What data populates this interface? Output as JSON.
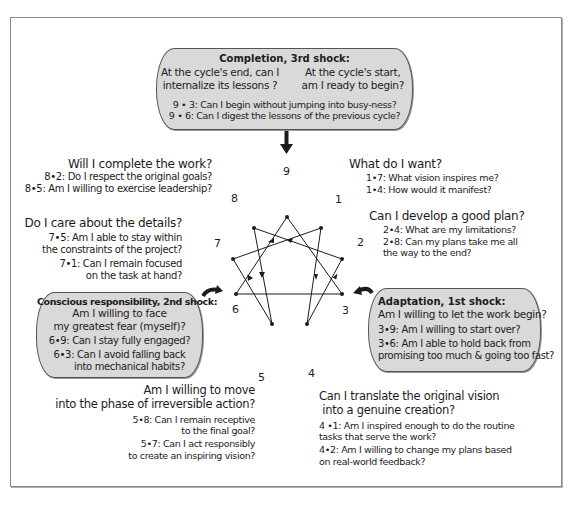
{
  "diagram": {
    "type": "enneagram",
    "points": [
      "1",
      "2",
      "3",
      "4",
      "5",
      "6",
      "7",
      "8",
      "9"
    ],
    "connections": [
      [
        "1",
        "4"
      ],
      [
        "4",
        "2"
      ],
      [
        "2",
        "8"
      ],
      [
        "8",
        "5"
      ],
      [
        "5",
        "7"
      ],
      [
        "7",
        "1"
      ],
      [
        "9",
        "3"
      ],
      [
        "3",
        "6"
      ],
      [
        "6",
        "9"
      ]
    ]
  },
  "shocks": {
    "completion": {
      "title": "Completion, 3rd shock:",
      "left_question": [
        "At the cycle's end, can I",
        "internalize its lessons ?"
      ],
      "right_question": [
        "At the cycle's start,",
        "am I ready to begin?"
      ],
      "items": [
        "9 • 3: Can I begin without jumping into busy-ness?",
        "9 • 6: Can I digest the lessons of the previous cycle?"
      ]
    },
    "conscious": {
      "title": "Conscious responsibility, 2nd shock:",
      "question": [
        "Am I willing to face",
        "my greatest fear (myself)?"
      ],
      "items": [
        "6•9: Can I stay fully engaged?",
        "6•3: Can I avoid falling back",
        "into mechanical habits?"
      ]
    },
    "adaptation": {
      "title": "Adaptation, 1st shock:",
      "question": "Am I willing to let the work begin?",
      "items": [
        "3•9: Am I willing to start over?",
        "3•6: Am I able to hold back from",
        "promising too much & going too fast?"
      ]
    }
  },
  "points": {
    "p1": {
      "num": "1",
      "question": "What do I want?",
      "items": [
        "1•7: What vision inspires me?",
        "1•4: How would it manifest?"
      ]
    },
    "p2": {
      "num": "2",
      "question": "Can I develop a good plan?",
      "items": [
        "2•4: What are my limitations?",
        "2•8: Can my plans take me all",
        "the way to the end?"
      ]
    },
    "p3": {
      "num": "3"
    },
    "p4": {
      "num": "4",
      "question": [
        "Can I translate the original vision",
        " into a genuine creation?"
      ],
      "items": [
        "4 •1: Am I inspired enough to do the routine",
        "tasks that serve the work?",
        "4•2: Am I willing to change my plans based",
        "on real-world feedback?"
      ]
    },
    "p5": {
      "num": "5",
      "question": [
        "Am I willing to move",
        "into the phase of irreversible action?"
      ],
      "items": [
        "5•8: Can I remain receptive",
        "to the final goal?",
        "5•7: Can I act responsibly",
        "to create an inspiring vision?"
      ]
    },
    "p6": {
      "num": "6"
    },
    "p7": {
      "num": "7",
      "question": "Do I care about the details?",
      "items": [
        "7•5: Am I able to stay within",
        "the constraints of the project?",
        "7•1: Can I remain focused",
        "on the task at hand?"
      ]
    },
    "p8": {
      "num": "8",
      "question": "Will I  complete the work?",
      "items": [
        "8•2: Do I respect the original goals?",
        "8•5: Am I willing to exercise leadership?"
      ]
    },
    "p9": {
      "num": "9"
    }
  },
  "colors": {
    "shock_fill": "#d9d9d9",
    "border": "#555555",
    "line": "#1c1c1c"
  }
}
